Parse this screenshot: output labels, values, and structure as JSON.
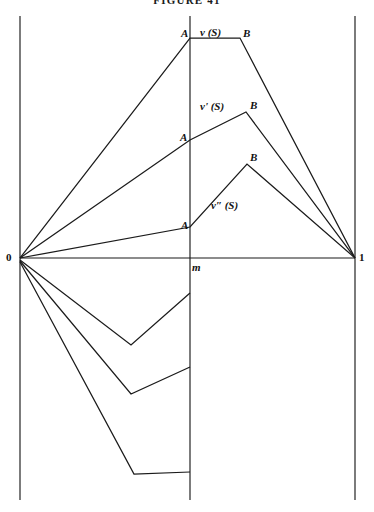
{
  "figure": {
    "title": "FIGURE 41",
    "background_color": "#ffffff",
    "stroke_color": "#1b1b1b",
    "width": 374,
    "height": 512
  },
  "axes": {
    "origin_label": "0",
    "midline_label": "m",
    "right_label": "1",
    "left_axis_x": 20,
    "mid_axis_x": 190,
    "right_axis_x": 355,
    "baseline_y": 258,
    "top_y": 16,
    "bottom_y": 500
  },
  "point_labels": {
    "a1": "A",
    "b1": "B",
    "a2": "A",
    "b2": "B",
    "a3": "A",
    "b3": "B"
  },
  "curve_labels": {
    "v": "v (S)",
    "v_prime": "v' (S)",
    "v_double_prime": "v″ (S)"
  },
  "chart_data": {
    "type": "line",
    "title": "FIGURE 41",
    "xlabel": "",
    "ylabel": "",
    "grid": false,
    "legend_position": "inline-annotations",
    "x_ticks": [
      {
        "value": 0,
        "label": "0",
        "pixel_x": 20
      },
      {
        "value": 0.515,
        "label": "m",
        "pixel_x": 190
      },
      {
        "value": 1,
        "label": "1",
        "pixel_x": 355
      }
    ],
    "y_zero_pixel": 258,
    "series": [
      {
        "name": "v (S)",
        "label_position": {
          "x": 200,
          "y": 27
        },
        "upper_points": [
          {
            "x": 20,
            "y": 258
          },
          {
            "x": 190,
            "y": 38
          },
          {
            "x": 240,
            "y": 38
          },
          {
            "x": 355,
            "y": 258
          }
        ],
        "vertex_A": {
          "x": 190,
          "y": 38
        },
        "vertex_B": {
          "x": 240,
          "y": 38
        },
        "lower_points": [
          {
            "x": 20,
            "y": 260
          },
          {
            "x": 131,
            "y": 345
          },
          {
            "x": 190,
            "y": 293
          }
        ]
      },
      {
        "name": "v' (S)",
        "label_position": {
          "x": 200,
          "y": 103
        },
        "upper_points": [
          {
            "x": 20,
            "y": 258
          },
          {
            "x": 190,
            "y": 140
          },
          {
            "x": 246,
            "y": 112
          },
          {
            "x": 355,
            "y": 258
          }
        ],
        "vertex_A": {
          "x": 190,
          "y": 140
        },
        "vertex_B": {
          "x": 246,
          "y": 112
        },
        "lower_points": [
          {
            "x": 20,
            "y": 261
          },
          {
            "x": 131,
            "y": 394
          },
          {
            "x": 190,
            "y": 367
          }
        ]
      },
      {
        "name": "v″ (S)",
        "label_position": {
          "x": 212,
          "y": 201
        },
        "upper_points": [
          {
            "x": 20,
            "y": 258
          },
          {
            "x": 190,
            "y": 227
          },
          {
            "x": 247,
            "y": 164
          },
          {
            "x": 355,
            "y": 258
          }
        ],
        "vertex_A": {
          "x": 190,
          "y": 227
        },
        "vertex_B": {
          "x": 247,
          "y": 164
        },
        "lower_points": [
          {
            "x": 20,
            "y": 262
          },
          {
            "x": 134,
            "y": 474
          },
          {
            "x": 190,
            "y": 472
          }
        ]
      }
    ]
  }
}
